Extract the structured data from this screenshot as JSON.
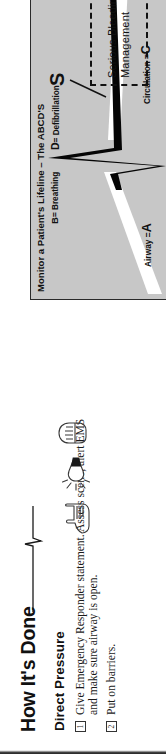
{
  "how_its_done": {
    "title": "How It's Done",
    "subtitle": "Direct Pressure",
    "steps": [
      {
        "num": "1",
        "text": "Give Emergency Responder statement. Assess scene, alert EMS and make sure airway is open."
      },
      {
        "num": "2",
        "text": "Put on barriers."
      }
    ],
    "icons": [
      "gloves-icon",
      "penlight-icon",
      "gloved-fist-icon"
    ]
  },
  "diagram": {
    "title": "Monitor a Patient's Lifeline – The ABCD'S",
    "labels": {
      "airway": "Airway =",
      "airway_letter": "A",
      "breathing_letter": "B",
      "breathing": "= Breathing",
      "circulation": "Circulation =",
      "circulation_letter": "C",
      "defibrillation_letter": "D",
      "defibrillation": "= Defibrillation",
      "s_letter": "S"
    },
    "callout": {
      "line1": "Serious Bleeding",
      "line2": "Management"
    },
    "colors": {
      "panel_fill": "#c7c7c7",
      "panel_border": "#2a2a2a",
      "waveform": "#000000",
      "baseline": "#ffffff"
    }
  }
}
